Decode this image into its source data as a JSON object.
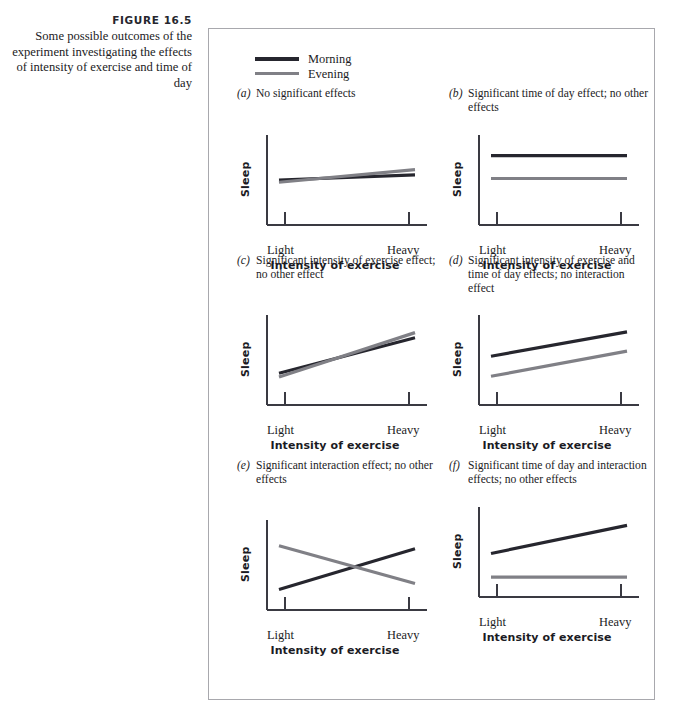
{
  "figure": {
    "number": "FIGURE  16.5",
    "caption": "Some possible outcomes of the experiment investigating the effects of intensity of exercise and time of day"
  },
  "legend": {
    "position": "top-left",
    "items": [
      {
        "label": "Morning",
        "color": "#26262e",
        "series_key": "morning"
      },
      {
        "label": "Evening",
        "color": "#808086",
        "series_key": "evening"
      }
    ]
  },
  "axes": {
    "xlabel": "Intensity of exercise",
    "ylabel": "Sleep",
    "xticks": [
      "Light",
      "Heavy"
    ]
  },
  "chart_data": [
    {
      "id": "a",
      "type": "line",
      "letter": "(a)",
      "title": "No significant effects",
      "xlabel": "Intensity of exercise",
      "ylabel": "Sleep",
      "categories": [
        "Light",
        "Heavy"
      ],
      "xlim": [
        0,
        1
      ],
      "ylim": [
        0,
        1
      ],
      "grid": false,
      "series": [
        {
          "name": "Morning",
          "color": "#26262e",
          "values": [
            0.5,
            0.57
          ]
        },
        {
          "name": "Evening",
          "color": "#808086",
          "values": [
            0.47,
            0.64
          ]
        }
      ]
    },
    {
      "id": "b",
      "type": "line",
      "letter": "(b)",
      "title": "Significant time of day effect; no other effects",
      "xlabel": "Intensity of exercise",
      "ylabel": "Sleep",
      "categories": [
        "Light",
        "Heavy"
      ],
      "xlim": [
        0,
        1
      ],
      "ylim": [
        0,
        1
      ],
      "grid": false,
      "series": [
        {
          "name": "Morning",
          "color": "#26262e",
          "values": [
            0.83,
            0.83
          ]
        },
        {
          "name": "Evening",
          "color": "#808086",
          "values": [
            0.52,
            0.52
          ]
        }
      ]
    },
    {
      "id": "c",
      "type": "line",
      "letter": "(c)",
      "title": "Significant intensity of exercise effect; no other effect",
      "xlabel": "Intensity of exercise",
      "ylabel": "Sleep",
      "categories": [
        "Light",
        "Heavy"
      ],
      "xlim": [
        0,
        1
      ],
      "ylim": [
        0,
        1
      ],
      "grid": false,
      "series": [
        {
          "name": "Morning",
          "color": "#26262e",
          "values": [
            0.32,
            0.8
          ]
        },
        {
          "name": "Evening",
          "color": "#808086",
          "values": [
            0.27,
            0.87
          ]
        }
      ]
    },
    {
      "id": "d",
      "type": "line",
      "letter": "(d)",
      "title": "Significant intensity of exercise and time of day effects; no interaction effect",
      "xlabel": "Intensity of exercise",
      "ylabel": "Sleep",
      "categories": [
        "Light",
        "Heavy"
      ],
      "xlim": [
        0,
        1
      ],
      "ylim": [
        0,
        1
      ],
      "grid": false,
      "series": [
        {
          "name": "Morning",
          "color": "#26262e",
          "values": [
            0.55,
            0.88
          ]
        },
        {
          "name": "Evening",
          "color": "#808086",
          "values": [
            0.28,
            0.62
          ]
        }
      ]
    },
    {
      "id": "e",
      "type": "line",
      "letter": "(e)",
      "title": "Significant interaction effect; no other effects",
      "xlabel": "Intensity of exercise",
      "ylabel": "Sleep",
      "categories": [
        "Light",
        "Heavy"
      ],
      "xlim": [
        0,
        1
      ],
      "ylim": [
        0,
        1
      ],
      "grid": false,
      "series": [
        {
          "name": "Morning",
          "color": "#26262e",
          "values": [
            0.17,
            0.72
          ]
        },
        {
          "name": "Evening",
          "color": "#808086",
          "values": [
            0.76,
            0.25
          ]
        }
      ]
    },
    {
      "id": "f",
      "type": "line",
      "letter": "(f)",
      "title": "Significant time of day and interaction effects; no other effects",
      "xlabel": "Intensity of exercise",
      "ylabel": "Sleep",
      "categories": [
        "Light",
        "Heavy"
      ],
      "xlim": [
        0,
        1
      ],
      "ylim": [
        0,
        1
      ],
      "grid": false,
      "series": [
        {
          "name": "Morning",
          "color": "#26262e",
          "values": [
            0.48,
            0.86
          ]
        },
        {
          "name": "Evening",
          "color": "#808086",
          "values": [
            0.16,
            0.16
          ]
        }
      ]
    }
  ],
  "panel_layout": [
    {
      "id": "a",
      "left": 28,
      "top": 58,
      "title_lines": 1
    },
    {
      "id": "b",
      "left": 240,
      "top": 58,
      "title_lines": 2
    },
    {
      "id": "c",
      "left": 28,
      "top": 225,
      "title_lines": 2
    },
    {
      "id": "d",
      "left": 240,
      "top": 225,
      "title_lines": 3
    },
    {
      "id": "e",
      "left": 28,
      "top": 430,
      "title_lines": 2
    },
    {
      "id": "f",
      "left": 240,
      "top": 430,
      "title_lines": 3
    }
  ]
}
